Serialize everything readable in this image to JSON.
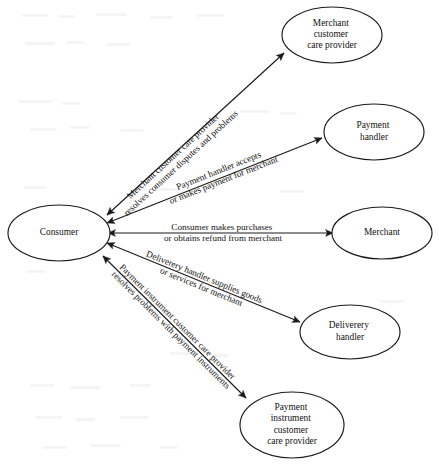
{
  "diagram": {
    "type": "node-link-diagram",
    "background_color": "#ffffff",
    "line_color": "#1a1a1a",
    "text_color": "#121212",
    "nodes": [
      {
        "id": "consumer",
        "label": "Consumer",
        "lines": [
          "Consumer"
        ],
        "cx": 59,
        "cy": 233,
        "rx": 51,
        "ry": 28
      },
      {
        "id": "merchant-customer-care-provider",
        "label": "Merchant customer care provider",
        "lines": [
          "Merchant",
          "customer",
          "care provider"
        ],
        "cx": 332,
        "cy": 35,
        "rx": 50,
        "ry": 28
      },
      {
        "id": "payment-handler",
        "label": "Payment handler",
        "lines": [
          "Payment",
          "handler"
        ],
        "cx": 374,
        "cy": 132,
        "rx": 50,
        "ry": 28
      },
      {
        "id": "merchant",
        "label": "Merchant",
        "lines": [
          "Merchant"
        ],
        "cx": 382,
        "cy": 233,
        "rx": 50,
        "ry": 26
      },
      {
        "id": "deliverery-handler",
        "label": "Deliverery handler",
        "lines": [
          "Deliverery",
          "handler"
        ],
        "cx": 350,
        "cy": 332,
        "rx": 50,
        "ry": 27
      },
      {
        "id": "payment-instrument-customer-care-provider",
        "label": "Payment instrument customer care provider",
        "lines": [
          "Payment",
          "instrument",
          "customer",
          "care provider"
        ],
        "cx": 292,
        "cy": 425,
        "rx": 52,
        "ry": 33
      }
    ],
    "edges": [
      {
        "id": "edge-merchant-care",
        "from": "consumer",
        "to": "merchant-customer-care-provider",
        "direction": "bidirectional",
        "label_lines": [
          "Merchant customer care provider",
          "resolves consumer disputes and problems"
        ]
      },
      {
        "id": "edge-payment-handler",
        "from": "consumer",
        "to": "payment-handler",
        "direction": "bidirectional",
        "label_lines": [
          "Payment handler accepts",
          "or makes payment for merchant"
        ]
      },
      {
        "id": "edge-merchant",
        "from": "consumer",
        "to": "merchant",
        "direction": "bidirectional",
        "label_lines": [
          "Consumer makes purchases",
          "or obtains refund from merchant"
        ]
      },
      {
        "id": "edge-deliverery-handler",
        "from": "consumer",
        "to": "deliverery-handler",
        "direction": "bidirectional",
        "label_lines": [
          "Deliverery handler supplies goods",
          "or services for merchant"
        ]
      },
      {
        "id": "edge-payment-instrument-care",
        "from": "consumer",
        "to": "payment-instrument-customer-care-provider",
        "direction": "bidirectional",
        "label_lines": [
          "Payment instrument customer care provider",
          "resolves problems with payment instruments"
        ]
      }
    ]
  }
}
